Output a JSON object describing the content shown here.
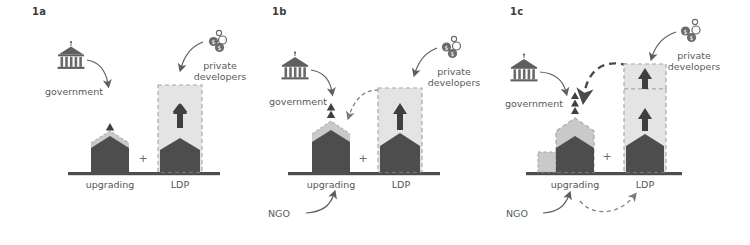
{
  "figure": {
    "type": "conceptual-diagram",
    "panel_count": 3,
    "colors": {
      "dark_fill": "#4d4d4d",
      "light_fill": "#d0d0d0",
      "lighter_fill": "#e2e2e2",
      "baseline": "#4d4d4d",
      "text": "#555555",
      "dashed_stroke": "#9a9a9a",
      "arrow_stroke": "#6a6a6a",
      "background": "#ffffff"
    }
  },
  "panels": [
    {
      "id": "1a",
      "label": "1a",
      "actors": [
        {
          "name": "government",
          "label": "government",
          "icon": "government-building-icon"
        },
        {
          "name": "private developers",
          "label": "private\ndevelopers",
          "icon": "money-coins-icon"
        }
      ],
      "bars": [
        {
          "name": "upgrading",
          "label": "upgrading",
          "dark_height": 45,
          "light_cap": 8,
          "growth_arrows": 1,
          "dashed_box": false
        },
        {
          "name": "LDP",
          "label": "LDP",
          "dark_height": 38,
          "light_box_height": 100,
          "growth_arrows": 1,
          "dashed_box": true
        }
      ],
      "operator": "+",
      "connectors": [
        {
          "from": "government",
          "to": "upgrading",
          "style": "solid"
        },
        {
          "from": "private developers",
          "to": "LDP",
          "style": "solid"
        }
      ]
    },
    {
      "id": "1b",
      "label": "1b",
      "actors": [
        {
          "name": "government",
          "label": "government",
          "icon": "government-building-icon"
        },
        {
          "name": "private developers",
          "label": "private\ndevelopers",
          "icon": "money-coins-icon"
        },
        {
          "name": "NGO",
          "label": "NGO",
          "icon": "none"
        }
      ],
      "bars": [
        {
          "name": "upgrading",
          "label": "upgrading",
          "dark_height": 55,
          "light_cap": 12,
          "growth_arrows": 2,
          "dashed_box": false
        },
        {
          "name": "LDP",
          "label": "LDP",
          "dark_height": 45,
          "light_box_height": 105,
          "growth_arrows": 1,
          "dashed_box": true
        }
      ],
      "operator": "+",
      "connectors": [
        {
          "from": "government",
          "to": "upgrading",
          "style": "solid"
        },
        {
          "from": "private developers",
          "to": "LDP",
          "style": "solid"
        },
        {
          "from": "LDP",
          "to": "upgrading",
          "style": "dashed"
        },
        {
          "from": "NGO",
          "to": "upgrading",
          "style": "solid"
        }
      ]
    },
    {
      "id": "1c",
      "label": "1c",
      "actors": [
        {
          "name": "government",
          "label": "government",
          "icon": "government-building-icon"
        },
        {
          "name": "private developers",
          "label": "private\ndevelopers",
          "icon": "money-coins-icon"
        },
        {
          "name": "NGO",
          "label": "NGO",
          "icon": "none"
        }
      ],
      "bars": [
        {
          "name": "upgrading",
          "label": "upgrading",
          "dark_height": 48,
          "light_cap": 42,
          "step_height": 28,
          "growth_arrows": 3,
          "dashed_box": true
        },
        {
          "name": "LDP",
          "label": "LDP",
          "dark_height": 45,
          "light_box_height": 110,
          "extension_height": 35,
          "growth_arrows": 2,
          "dashed_box": true
        }
      ],
      "operator": "+",
      "connectors": [
        {
          "from": "government",
          "to": "upgrading",
          "style": "solid"
        },
        {
          "from": "private developers",
          "to": "LDP",
          "style": "solid"
        },
        {
          "from": "LDP",
          "to": "upgrading",
          "style": "dashed-bold"
        },
        {
          "from": "NGO",
          "to": "upgrading",
          "style": "solid"
        },
        {
          "from": "NGO",
          "to": "LDP",
          "style": "dashed"
        }
      ]
    }
  ],
  "labels": {
    "government": "government",
    "private_developers_line1": "private",
    "private_developers_line2": "developers",
    "ngo": "NGO",
    "upgrading": "upgrading",
    "ldp": "LDP",
    "plus": "+",
    "p1a": "1a",
    "p1b": "1b",
    "p1c": "1c"
  }
}
